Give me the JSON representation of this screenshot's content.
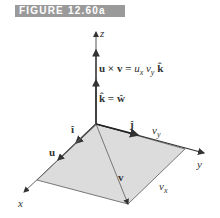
{
  "figure": {
    "caption": "FIGURE 12.60a",
    "banner_color": "#9a9a9a",
    "surface_color": "#dcdcdc",
    "axes": {
      "x": "x",
      "y": "y",
      "z": "z"
    },
    "labels": {
      "cross_product": "u × v = ",
      "cross_product_ux": "u",
      "cross_product_ux_sub": "x",
      "cross_product_vy": "v",
      "cross_product_vy_sub": "y",
      "cross_product_k": "k̂",
      "k_equals_w": "k̂ = ŵ",
      "i_hat": "î",
      "j_hat": "ĵ",
      "u": "u",
      "v": "v",
      "vy": "v",
      "vy_sub": "y",
      "vx": "v",
      "vx_sub": "x"
    }
  }
}
